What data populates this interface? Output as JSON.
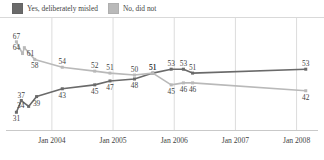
{
  "legend": {
    "items": [
      {
        "label": "Yes, deliberately misled",
        "color": "#6a6a6a",
        "icon": "legend-swatch-icon"
      },
      {
        "label": "No, did not",
        "color": "#b9b9b9",
        "icon": "legend-swatch-icon"
      }
    ]
  },
  "axis": {
    "ticks": [
      "Jan 2004",
      "Jan 2005",
      "Jan 2006",
      "Jan 2007",
      "Jan 2008"
    ]
  },
  "chart_data": {
    "type": "line",
    "title": "",
    "subtitle": "",
    "xlabel": "",
    "ylabel": "",
    "ylim": [
      25,
      72
    ],
    "xlim": [
      2003.25,
      2008.35
    ],
    "grid": true,
    "gridlines_x": [
      2004.0,
      2005.0,
      2006.0,
      2007.0,
      2008.0
    ],
    "legend_position": "top-left",
    "series": [
      {
        "name": "Yes, deliberately misled",
        "color": "#6a6a6a",
        "points": [
          {
            "x": 2003.42,
            "y": 31,
            "label": "31",
            "label_pos": "below"
          },
          {
            "x": 2003.5,
            "y": 37,
            "label": "37",
            "label_pos": "above"
          },
          {
            "x": 2003.62,
            "y": 34,
            "label": "34",
            "label_pos": "left"
          },
          {
            "x": 2003.75,
            "y": 39,
            "label": "39",
            "label_pos": "below"
          },
          {
            "x": 2004.17,
            "y": 43,
            "label": "43",
            "label_pos": "below"
          },
          {
            "x": 2004.7,
            "y": 45,
            "label": "45",
            "label_pos": "below"
          },
          {
            "x": 2004.95,
            "y": 47,
            "label": "47",
            "label_pos": "below"
          },
          {
            "x": 2005.35,
            "y": 48,
            "label": "48",
            "label_pos": "below"
          },
          {
            "x": 2005.65,
            "y": 51,
            "label": "51",
            "label_pos": "above"
          },
          {
            "x": 2005.95,
            "y": 53,
            "label": "53",
            "label_pos": "above"
          },
          {
            "x": 2006.15,
            "y": 53,
            "label": "53",
            "label_pos": "above"
          },
          {
            "x": 2006.3,
            "y": 51,
            "label": "51",
            "label_pos": "above"
          },
          {
            "x": 2008.15,
            "y": 53,
            "label": "53",
            "label_pos": "above"
          }
        ]
      },
      {
        "name": "No, did not",
        "color": "#b9b9b9",
        "points": [
          {
            "x": 2003.42,
            "y": 67,
            "label": "67",
            "label_pos": "above"
          },
          {
            "x": 2003.52,
            "y": 61,
            "label": "61",
            "label_pos": "right"
          },
          {
            "x": 2003.55,
            "y": 64,
            "label": "64",
            "label_pos": "left"
          },
          {
            "x": 2003.72,
            "y": 58,
            "label": "58",
            "label_pos": "below"
          },
          {
            "x": 2004.17,
            "y": 54,
            "label": "54",
            "label_pos": "above"
          },
          {
            "x": 2004.7,
            "y": 52,
            "label": "52",
            "label_pos": "above"
          },
          {
            "x": 2004.95,
            "y": 51,
            "label": "51",
            "label_pos": "above"
          },
          {
            "x": 2005.35,
            "y": 50,
            "label": "50",
            "label_pos": "above"
          },
          {
            "x": 2005.65,
            "y": 51,
            "label": "51",
            "label_pos": "above"
          },
          {
            "x": 2005.95,
            "y": 45,
            "label": "45",
            "label_pos": "below"
          },
          {
            "x": 2006.15,
            "y": 46,
            "label": "46",
            "label_pos": "below"
          },
          {
            "x": 2006.3,
            "y": 46,
            "label": "46",
            "label_pos": "below"
          },
          {
            "x": 2008.15,
            "y": 42,
            "label": "42",
            "label_pos": "below"
          }
        ]
      }
    ]
  }
}
